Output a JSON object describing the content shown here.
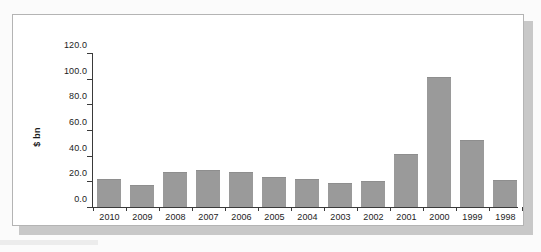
{
  "figure": {
    "frame_border_color": "#b4b4b4",
    "shadow_color": "#c8c8c8",
    "page_background_color": "#fbfbfb",
    "plot_background_color": "#ffffff"
  },
  "chart_data": {
    "type": "bar",
    "title": "",
    "subtitle": "",
    "xlabel": "",
    "ylabel": "$ bn",
    "categories": [
      "2010",
      "2009",
      "2008",
      "2007",
      "2006",
      "2005",
      "2004",
      "2003",
      "2002",
      "2001",
      "2000",
      "1999",
      "1998"
    ],
    "values": [
      22.0,
      17.0,
      27.5,
      29.0,
      27.0,
      23.5,
      22.0,
      19.0,
      20.0,
      41.5,
      101.0,
      52.0,
      21.0
    ],
    "ylim": [
      0,
      120
    ],
    "ytick_values": [
      0,
      20,
      40,
      60,
      80,
      100,
      120
    ],
    "ytick_labels": [
      "0.0",
      "20.0",
      "40.0",
      "60.0",
      "80.0",
      "100.0",
      "120.0"
    ],
    "grid": false,
    "legend": false,
    "legend_position": "none",
    "bar_color": "#9a9a9a",
    "axis_color": "#3a3a3a",
    "text_color": "#1c1c1c"
  }
}
